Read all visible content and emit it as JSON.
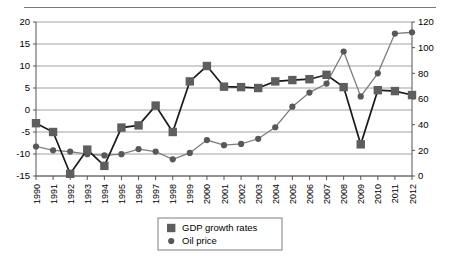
{
  "chart_data": {
    "type": "line",
    "title": "",
    "xlabel": "",
    "ylabel": "",
    "grid": true,
    "legend_position": "bottom-center",
    "categories": [
      "1990",
      "1991",
      "1992",
      "1993",
      "1994",
      "1995",
      "1996",
      "1997",
      "1998",
      "1999",
      "2000",
      "2001",
      "2002",
      "2003",
      "2004",
      "2005",
      "2006",
      "2007",
      "2008",
      "2009",
      "2010",
      "2011",
      "2012"
    ],
    "axes": {
      "left": {
        "label": "GDP growth rates",
        "min": -15,
        "max": 20,
        "step": 5,
        "ticks": [
          "-15",
          "-10",
          "-5",
          "0",
          "5",
          "10",
          "15",
          "20"
        ]
      },
      "right": {
        "label": "Oil price",
        "min": 0,
        "max": 120,
        "step": 20,
        "ticks": [
          "0",
          "20",
          "40",
          "60",
          "80",
          "100",
          "120"
        ]
      }
    },
    "series": [
      {
        "name": "GDP growth rates",
        "axis": "left",
        "marker": "square",
        "color": "#5e5e5e",
        "line_color": "#1a1a1a",
        "values": [
          -3.0,
          -5.0,
          -14.5,
          -9.0,
          -12.7,
          -4.0,
          -3.5,
          1.0,
          -5.0,
          6.5,
          10.0,
          5.3,
          5.2,
          5.0,
          6.5,
          6.8,
          7.0,
          8.0,
          5.2,
          -7.8,
          4.5,
          4.3,
          3.4
        ]
      },
      {
        "name": "Oil price",
        "axis": "right",
        "marker": "circle",
        "color": "#585858",
        "line_color": "#7d7d7d",
        "values": [
          23,
          20,
          19,
          17,
          16,
          17,
          21,
          19,
          13,
          18,
          28,
          24,
          25,
          29,
          38,
          54,
          65,
          72,
          97,
          62,
          80,
          111,
          112
        ]
      }
    ],
    "legend": [
      {
        "label": "GDP growth rates",
        "marker": "square",
        "color": "#5e5e5e"
      },
      {
        "label": "Oil price",
        "marker": "circle",
        "color": "#585858"
      }
    ]
  }
}
